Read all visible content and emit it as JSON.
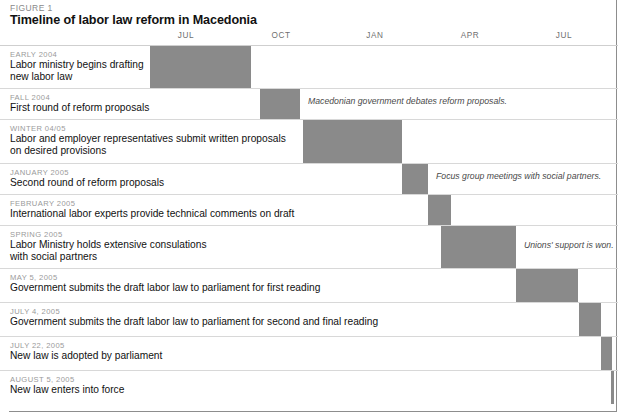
{
  "figure": {
    "label": "FIGURE 1",
    "title": "Timeline of labor law reform in Macedonia"
  },
  "colors": {
    "bar": "#8a8a8a",
    "date_label": "#9a9a9a",
    "description": "#111111",
    "annotation": "#4a4a4a",
    "axis_label": "#6f6f6f",
    "row_separator": "#d8d8d8",
    "frame": "#8d8d8d",
    "background": "#ffffff"
  },
  "chart_data": {
    "type": "bar",
    "title": "Timeline of labor law reform in Macedonia",
    "xlabel": "",
    "ylabel": "",
    "orientation": "horizontal-gantt",
    "grid": false,
    "legend": "none",
    "axis_ticks": [
      {
        "label": "JUL",
        "x": 186
      },
      {
        "label": "OCT",
        "x": 281
      },
      {
        "label": "JAN",
        "x": 375
      },
      {
        "label": "APR",
        "x": 470
      },
      {
        "label": "JUL",
        "x": 564
      }
    ],
    "axis_range_px": [
      10,
      614
    ],
    "categories": [
      "EARLY 2004",
      "FALL 2004",
      "WINTER 04/05",
      "JANUARY 2005",
      "FEBRUARY 2005",
      "SPRING 2005",
      "MAY 5, 2005",
      "JULY 4, 2005",
      "JULY 22, 2005",
      "AUGUST 5, 2005"
    ],
    "bars_px": [
      {
        "start": 150,
        "end": 251
      },
      {
        "start": 251,
        "end": 300
      },
      {
        "start": 300,
        "end": 402
      },
      {
        "start": 402,
        "end": 428
      },
      {
        "start": 428,
        "end": 451
      },
      {
        "start": 441,
        "end": 516
      },
      {
        "start": 516,
        "end": 578
      },
      {
        "start": 579,
        "end": 601
      },
      {
        "start": 601,
        "end": 612
      },
      {
        "start": 611,
        "end": 614
      }
    ]
  },
  "rows": [
    {
      "date": "EARLY 2004",
      "description": "Labor ministry begins drafting\nnew labor law",
      "bar_left": 150,
      "bar_width": 101,
      "height": 43,
      "text_width": 140
    },
    {
      "date": "FALL 2004",
      "description": "First round of reform proposals",
      "bar_left": 251,
      "bar_width": 49,
      "height": 31,
      "text_width": 250
    },
    {
      "date": "WINTER 04/05",
      "description": "Labor and employer representatives submit written proposals\non desired provisions",
      "bar_left": 300,
      "bar_width": 102,
      "height": 44,
      "text_width": 293
    },
    {
      "date": "JANUARY 2005",
      "description": "Second round of reform proposals",
      "bar_left": 402,
      "bar_width": 26,
      "height": 31,
      "text_width": 252
    },
    {
      "date": "FEBRUARY 2005",
      "description": "International labor experts provide technical comments on draft",
      "bar_left": 428,
      "bar_width": 23,
      "height": 31,
      "text_width": 299
    },
    {
      "date": "SPRING 2005",
      "description": "Labor Ministry holds extensive consulations\nwith social partners",
      "bar_left": 441,
      "bar_width": 75,
      "height": 43,
      "text_width": 225
    },
    {
      "date": "MAY 5, 2005",
      "description": "Government submits the draft labor law to parliament for first reading",
      "bar_left": 516,
      "bar_width": 62,
      "height": 34,
      "text_width": 335
    },
    {
      "date": "JULY 4, 2005",
      "description": "Government submits the draft labor law to parliament for second and final reading",
      "bar_left": 579,
      "bar_width": 22,
      "height": 34,
      "text_width": 385
    },
    {
      "date": "JULY 22, 2005",
      "description": "New law is adopted by parliament",
      "bar_left": 601,
      "bar_width": 11,
      "height": 34,
      "text_width": 250
    },
    {
      "date": "AUGUST 5, 2005",
      "description": "New law enters into force",
      "bar_left": 611,
      "bar_width": 3,
      "height": 34,
      "text_width": 250
    }
  ],
  "annotations": [
    {
      "text": "Macedonian government debates reform proposals.",
      "left": 308,
      "top": 96
    },
    {
      "text": "Focus group meetings with social partners.",
      "left": 436,
      "top": 171
    },
    {
      "text": "Unions' support is won.",
      "left": 524,
      "top": 240
    }
  ]
}
